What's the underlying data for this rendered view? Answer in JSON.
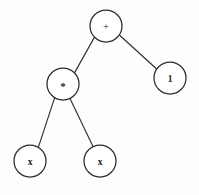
{
  "diagram": {
    "kind": "expression-tree",
    "expression": "x * x + 1",
    "background_color": "#fdfdfc",
    "node_fill_color": "#ffffff",
    "node_stroke_color": "#2b2b30",
    "edge_color": "#2f2f33",
    "nodes": [
      {
        "id": "root",
        "label": "+",
        "cx": 106,
        "cy": 26,
        "r": 16
      },
      {
        "id": "times",
        "label": "*",
        "cx": 63,
        "cy": 84,
        "r": 16
      },
      {
        "id": "one",
        "label": "1",
        "cx": 170,
        "cy": 78,
        "r": 16
      },
      {
        "id": "x-left",
        "label": "x",
        "cx": 30,
        "cy": 161,
        "r": 16
      },
      {
        "id": "x-right",
        "label": "x",
        "cx": 100,
        "cy": 161,
        "r": 16
      }
    ],
    "edges": [
      {
        "id": "root-times",
        "from": "root",
        "to": "times",
        "x1": 94.5,
        "y1": 37.1,
        "x2": 74.5,
        "y2": 72.9
      },
      {
        "id": "root-one",
        "from": "root",
        "to": "one",
        "x1": 119.6,
        "y1": 35.3,
        "x2": 156.4,
        "y2": 68.7
      },
      {
        "id": "times-xleft",
        "from": "times",
        "to": "x-left",
        "x1": 54.6,
        "y1": 97.9,
        "x2": 38.4,
        "y2": 147.1
      },
      {
        "id": "times-xright",
        "from": "times",
        "to": "x-right",
        "x1": 70.0,
        "y1": 98.4,
        "x2": 93.0,
        "y2": 146.6
      }
    ]
  }
}
